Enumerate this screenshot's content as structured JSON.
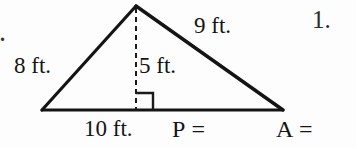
{
  "page": {
    "background_color": "#fdfdfd",
    "ink_color": "#141414",
    "width": 356,
    "height": 148
  },
  "worksheet": {
    "item_number": "1.",
    "stray_mark": ".",
    "figure": {
      "shape_name": "triangle",
      "has_altitude": true,
      "altitude_style": "dashed",
      "right_angle_marker": true,
      "vertices": {
        "apex": [
          136,
          6
        ],
        "bottom_left": [
          42,
          110
        ],
        "bottom_right": [
          283,
          110
        ],
        "foot_of_altitude": [
          136,
          110
        ]
      }
    },
    "labels": {
      "left_side": "8 ft.",
      "right_side": "9 ft.",
      "height": "5 ft.",
      "base": "10 ft."
    },
    "answers": {
      "perimeter_prompt": "P =",
      "area_prompt": "A ="
    }
  }
}
